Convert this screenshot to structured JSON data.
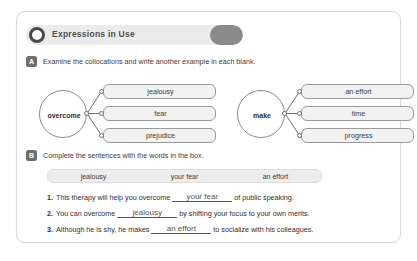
{
  "header": {
    "title": "Expressions in Use",
    "circle_icon": "circle-outline-icon"
  },
  "section_a": {
    "marker": "A",
    "instruction": "Examine the collocations and write another example in each blank.",
    "diagrams": [
      {
        "hub": "overcome",
        "boxes": [
          "jealousy",
          "fear",
          "prejudice"
        ]
      },
      {
        "hub": "make",
        "boxes": [
          "an effort",
          "time",
          "progress"
        ]
      }
    ]
  },
  "section_b": {
    "marker": "B",
    "instruction": "Complete the sentences with the words in the box.",
    "wordbank": [
      "jealousy",
      "your fear",
      "an effort"
    ],
    "sentences": [
      {
        "number": "1.",
        "before": "This therapy will help you overcome",
        "answer": "your fear",
        "after": "of public speaking."
      },
      {
        "number": "2.",
        "before": "You can overcome",
        "answer": "jealousy",
        "after": "by shifting your focus to your own merits."
      },
      {
        "number": "3.",
        "before": "Although he is shy, he makes",
        "answer": "an effort",
        "after": "to socialize with his colleagues."
      }
    ]
  }
}
